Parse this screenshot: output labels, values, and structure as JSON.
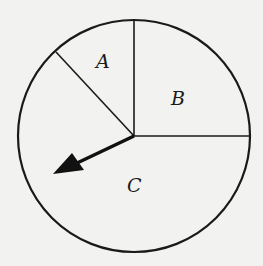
{
  "diagram": {
    "type": "spinner",
    "regions": [
      {
        "label": "A",
        "start_deg": 90,
        "end_deg": 135,
        "fraction": "1/8"
      },
      {
        "label": "B",
        "start_deg": 0,
        "end_deg": 90,
        "fraction": "1/4"
      },
      {
        "label": "C",
        "start_deg": 135,
        "end_deg": 360,
        "fraction": "5/8"
      }
    ],
    "arrow": {
      "points_to": "C",
      "angle_deg": 205
    },
    "colors": {
      "stroke": "#1a1a1a",
      "background": "#f2f2f0"
    }
  }
}
